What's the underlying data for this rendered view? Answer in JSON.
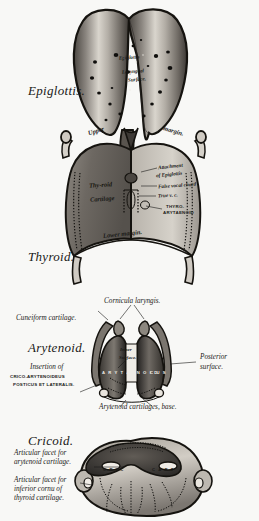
{
  "plate": {
    "title": "Cartilages of the Larynx",
    "background": "#f8f8f6",
    "ink": "#1a1a18"
  },
  "figures": [
    {
      "id": "epiglottis",
      "name": "Epiglottis",
      "caption": "Epiglottis.",
      "labels": [
        {
          "key": "title",
          "text": "Epiglottis"
        },
        {
          "key": "surface",
          "text": "Laryngeal"
        },
        {
          "key": "surface2",
          "text": "Surface."
        }
      ]
    },
    {
      "id": "thyroid",
      "name": "Thyroid cartilage",
      "caption": "Thyroid.",
      "labels": [
        {
          "key": "upper",
          "text": "Upper"
        },
        {
          "key": "margin",
          "text": "margin."
        },
        {
          "key": "thyroid1",
          "text": "Thy-roid"
        },
        {
          "key": "thyroid2",
          "text": "Cartilage"
        },
        {
          "key": "lower",
          "text": "Lower margin."
        },
        {
          "key": "attach1",
          "text": "Attachment"
        },
        {
          "key": "attach2",
          "text": "of Epiglottis"
        },
        {
          "key": "false_cord",
          "text": "False vocal chord"
        },
        {
          "key": "true_cord",
          "text": "True v. c."
        },
        {
          "key": "thyro1",
          "text": "THYRO-"
        },
        {
          "key": "thyro2",
          "text": "ARYTAENOID"
        }
      ]
    },
    {
      "id": "arytenoid",
      "name": "Arytenoid cartilages",
      "caption": "Arytenoid.",
      "labels": [
        {
          "key": "cornicula",
          "text": "Cornicula laryngis."
        },
        {
          "key": "cuneiform",
          "text": "Cuneiform cartilage."
        },
        {
          "key": "posterior1",
          "text": "Posterior"
        },
        {
          "key": "posterior2",
          "text": "surface."
        },
        {
          "key": "inner1",
          "text": "Inner"
        },
        {
          "key": "inner2",
          "text": "Surface."
        },
        {
          "key": "spread_l",
          "text": "A R Y T AE N O I D"
        },
        {
          "key": "spread_r",
          "text": "C U S"
        },
        {
          "key": "insertion",
          "text": "Insertion of"
        },
        {
          "key": "crico1",
          "text": "CRICO-ARYTENOIDEUS"
        },
        {
          "key": "crico2",
          "text": "POSTICUS ET LATERALIS."
        },
        {
          "key": "base",
          "text": "Arytenoid cartilages, base."
        }
      ]
    },
    {
      "id": "cricoid",
      "name": "Cricoid cartilage",
      "caption": "Cricoid.",
      "labels": [
        {
          "key": "facet_ary1",
          "text": "Articular facet for"
        },
        {
          "key": "facet_ary2",
          "text": "arytenoid cartilage."
        },
        {
          "key": "facet_thy1",
          "text": "Articular facet for"
        },
        {
          "key": "facet_thy2",
          "text": "inferior cornu of"
        },
        {
          "key": "facet_thy3",
          "text": "thyroid cartilage."
        },
        {
          "key": "inner_l",
          "text": "C R I C"
        },
        {
          "key": "inner_r",
          "text": "C A R T"
        }
      ]
    }
  ]
}
